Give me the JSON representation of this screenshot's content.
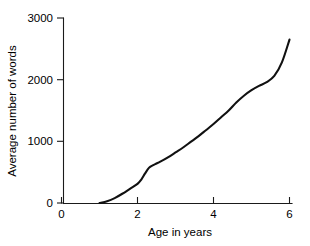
{
  "chart_data": {
    "type": "line",
    "title": "",
    "xlabel": "Age in years",
    "ylabel": "Average number of words",
    "xlim": [
      0,
      6.2
    ],
    "ylim": [
      0,
      3000
    ],
    "xticks": [
      0,
      2,
      4,
      6
    ],
    "xtick_labels": [
      "0",
      "2",
      "4",
      "6"
    ],
    "yticks": [
      0,
      1000,
      2000,
      3000
    ],
    "ytick_labels": [
      "0",
      "1000",
      "2000",
      "3000"
    ],
    "grid": false,
    "legend": false,
    "series": [
      {
        "name": "Average number of words",
        "color": "#111111",
        "x": [
          1.0,
          1.2,
          1.4,
          1.6,
          1.8,
          2.0,
          2.1,
          2.2,
          2.3,
          2.4,
          2.5,
          2.6,
          2.8,
          3.0,
          3.2,
          3.4,
          3.6,
          3.8,
          4.0,
          4.2,
          4.4,
          4.6,
          4.8,
          5.0,
          5.2,
          5.4,
          5.6,
          5.8,
          6.0
        ],
        "values": [
          0,
          30,
          80,
          150,
          230,
          310,
          380,
          480,
          570,
          610,
          640,
          670,
          740,
          820,
          900,
          990,
          1080,
          1180,
          1280,
          1390,
          1500,
          1630,
          1740,
          1830,
          1900,
          1960,
          2060,
          2280,
          2650
        ]
      }
    ]
  },
  "axes": {
    "y_axis_title": "Average number of words",
    "x_axis_title": "Age in years"
  }
}
